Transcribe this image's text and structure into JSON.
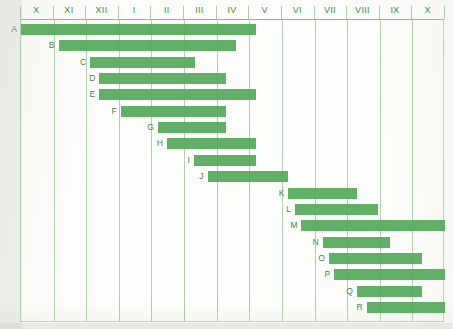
{
  "chart_data": {
    "type": "bar",
    "subtype": "gantt",
    "title": "",
    "xlabel": "",
    "ylabel": "",
    "grid": true,
    "legend": "none",
    "orientation": "horizontal",
    "x_axis": {
      "position": "top",
      "unit": "month",
      "tick_labels": [
        "X",
        "XI",
        "XII",
        "I",
        "II",
        "III",
        "IV",
        "V",
        "VI",
        "VII",
        "VIII",
        "IX",
        "X"
      ],
      "xlim": [
        0,
        13
      ]
    },
    "categories": [
      "A",
      "B",
      "C",
      "D",
      "E",
      "F",
      "G",
      "H",
      "I",
      "J",
      "K",
      "L",
      "M",
      "N",
      "O",
      "P",
      "Q",
      "R"
    ],
    "tasks": [
      {
        "label": "A",
        "start": 0.0,
        "end": 7.2
      },
      {
        "label": "B",
        "start": 1.15,
        "end": 6.6
      },
      {
        "label": "C",
        "start": 2.12,
        "end": 5.35
      },
      {
        "label": "D",
        "start": 2.4,
        "end": 6.3
      },
      {
        "label": "E",
        "start": 2.4,
        "end": 7.2
      },
      {
        "label": "F",
        "start": 3.06,
        "end": 6.3
      },
      {
        "label": "G",
        "start": 4.2,
        "end": 6.3
      },
      {
        "label": "H",
        "start": 4.47,
        "end": 7.2
      },
      {
        "label": "I",
        "start": 5.3,
        "end": 7.2
      },
      {
        "label": "J",
        "start": 5.72,
        "end": 8.2
      },
      {
        "label": "K",
        "start": 8.2,
        "end": 10.3
      },
      {
        "label": "L",
        "start": 8.4,
        "end": 10.95
      },
      {
        "label": "M",
        "start": 8.6,
        "end": 13.0
      },
      {
        "label": "N",
        "start": 9.25,
        "end": 11.3
      },
      {
        "label": "O",
        "start": 9.44,
        "end": 12.3
      },
      {
        "label": "P",
        "start": 9.6,
        "end": 13.0
      },
      {
        "label": "Q",
        "start": 10.3,
        "end": 12.3
      },
      {
        "label": "R",
        "start": 10.6,
        "end": 13.0
      }
    ],
    "colors": {
      "bar": "#55a85a",
      "grid": "#c9dec6",
      "frame": "#b9d5b6",
      "text": "#3f8a46",
      "background": "#fdfdfb"
    }
  }
}
